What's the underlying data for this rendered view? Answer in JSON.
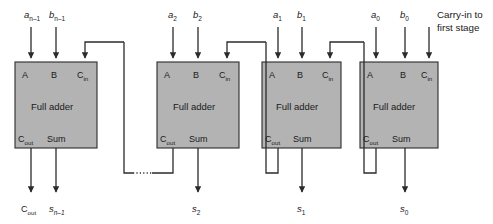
{
  "diagram": {
    "type": "logic-block-diagram",
    "colors": {
      "block_fill": "#b3b3b3",
      "stroke": "#2b2b2b",
      "background": "#ffffff",
      "text": "#1a1a1a"
    },
    "block_label": "Full adder",
    "ports": {
      "a": "A",
      "b": "B",
      "cin_main": "C",
      "cin_sub": "in",
      "cout_main": "C",
      "cout_sub": "out",
      "sum": "Sum"
    },
    "annotation": {
      "carry_in_note_line1": "Carry-in to",
      "carry_in_note_line2": "first stage"
    },
    "final_carry_out": {
      "main": "C",
      "sub": "out"
    },
    "continuation_marker": "dotted-wire-ellipsis",
    "stages": [
      {
        "id": "stage-n-1",
        "index": 0,
        "input_a_main": "a",
        "input_a_sub": "n–1",
        "input_b_main": "b",
        "input_b_sub": "n–1",
        "sum_main": "s",
        "sum_sub": "n–1",
        "box": {
          "x": 15,
          "y": 62,
          "w": 82,
          "h": 86
        }
      },
      {
        "id": "stage-2",
        "index": 1,
        "input_a_main": "a",
        "input_a_sub": "2",
        "input_b_main": "b",
        "input_b_sub": "2",
        "sum_main": "s",
        "sum_sub": "2",
        "box": {
          "x": 157,
          "y": 62,
          "w": 82,
          "h": 86
        }
      },
      {
        "id": "stage-1",
        "index": 2,
        "input_a_main": "a",
        "input_a_sub": "1",
        "input_b_main": "b",
        "input_b_sub": "1",
        "sum_main": "s",
        "sum_sub": "1",
        "box": {
          "x": 262,
          "y": 62,
          "w": 79,
          "h": 86
        }
      },
      {
        "id": "stage-0",
        "index": 3,
        "input_a_main": "a",
        "input_a_sub": "0",
        "input_b_main": "b",
        "input_b_sub": "0",
        "sum_main": "s",
        "sum_sub": "0",
        "box": {
          "x": 360,
          "y": 62,
          "w": 78,
          "h": 86
        }
      }
    ]
  }
}
